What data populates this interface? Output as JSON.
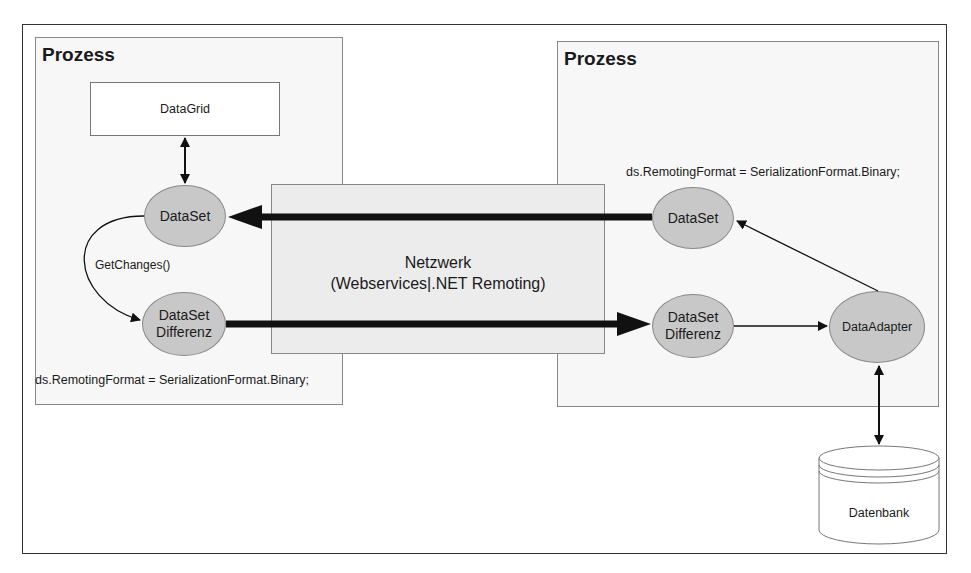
{
  "diagram": {
    "left_process": {
      "title": "Prozess",
      "datagrid_label": "DataGrid",
      "dataset_label": "DataSet",
      "diff_label_line1": "DataSet",
      "diff_label_line2": "Differenz",
      "getchanges_label": "GetChanges()",
      "code": "ds.RemotingFormat = SerializationFormat.Binary;"
    },
    "network": {
      "line1": "Netzwerk",
      "line2": "(Webservices|.NET Remoting)"
    },
    "right_process": {
      "title": "Prozess",
      "code": "ds.RemotingFormat = SerializationFormat.Binary;",
      "dataset_label": "DataSet",
      "diff_label_line1": "DataSet",
      "diff_label_line2": "Differenz",
      "adapter_label": "DataAdapter"
    },
    "database": {
      "label": "Datenbank"
    },
    "colors": {
      "node_fill": "#c8c8c8",
      "network_fill": "#ececec",
      "process_fill": "#f7f7f7",
      "arrow": "#111111"
    }
  }
}
